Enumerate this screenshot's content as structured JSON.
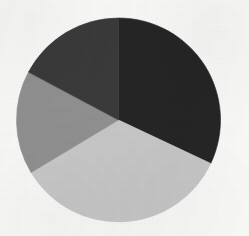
{
  "figure": {
    "background_color": "#fbfbfa",
    "center_x": 118.5,
    "center_y": 120,
    "radius": 102
  },
  "chart_data": {
    "type": "pie",
    "title": "",
    "subtitle": "",
    "xlabel": "",
    "ylabel": "",
    "grid": false,
    "legend": "none",
    "annotations": [],
    "start_angle_deg": 0,
    "direction": "clockwise",
    "categories": [
      "Slice 1",
      "Slice 2",
      "Slice 3",
      "Slice 4"
    ],
    "values": [
      32.0,
      34.4,
      16.4,
      17.2
    ],
    "colors": [
      "#262526",
      "#c9c9c9",
      "#919191",
      "#3a3a3a"
    ],
    "slices": [
      {
        "name": "Slice 1",
        "label": "",
        "value": 32.0,
        "color": "#262526",
        "start_angle_deg": 0,
        "end_angle_deg": 115.2,
        "tone": "black"
      },
      {
        "name": "Slice 2",
        "label": "",
        "value": 34.4,
        "color": "#c9c9c9",
        "start_angle_deg": 115.2,
        "end_angle_deg": 239.0,
        "tone": "light-gray"
      },
      {
        "name": "Slice 3",
        "label": "",
        "value": 16.4,
        "color": "#919191",
        "start_angle_deg": 239.0,
        "end_angle_deg": 298.0,
        "tone": "medium-gray"
      },
      {
        "name": "Slice 4",
        "label": "",
        "value": 17.2,
        "color": "#3a3a3a",
        "start_angle_deg": 298.0,
        "end_angle_deg": 360.0,
        "tone": "dark-gray"
      }
    ]
  }
}
